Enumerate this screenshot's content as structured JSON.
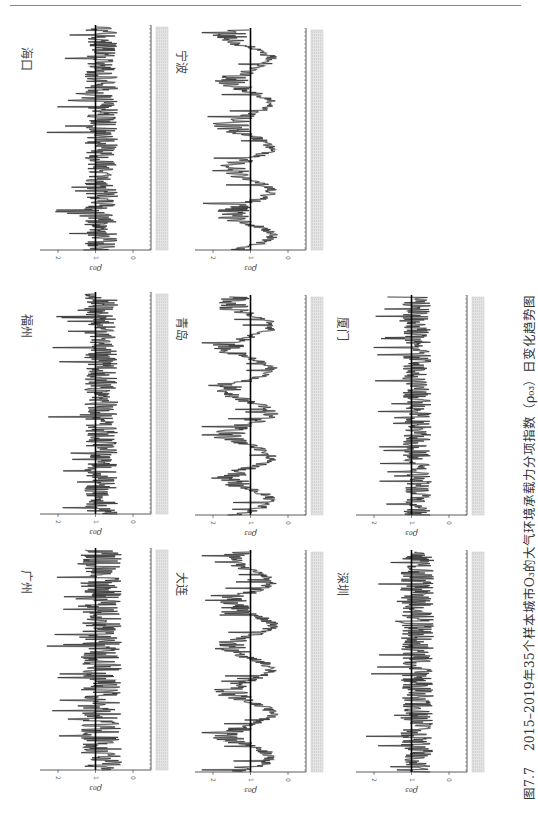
{
  "header": {
    "text": ""
  },
  "caption": {
    "figure_no": "图7.7",
    "text": "2015–2019年35个样本城市O₃的大气环境承载力分项指数（ρ₀₃）日变化趋势图"
  },
  "chart_data": [
    {
      "type": "line",
      "title": "海口",
      "xlabel": "日期 (2015–2019)",
      "ylabel": "ρ_O3",
      "ylim": [
        0,
        2.5
      ],
      "yticks": [
        0,
        1,
        2
      ],
      "reference_line": 1,
      "orientation": "rotated-90",
      "mean_level": 0.8,
      "spikes_to": 2.0
    },
    {
      "type": "line",
      "title": "宁波",
      "xlabel": "日期 (2015–2019)",
      "ylabel": "ρ_O3",
      "ylim": [
        0,
        2.5
      ],
      "yticks": [
        0,
        1,
        2
      ],
      "reference_line": 1,
      "orientation": "rotated-90",
      "mean_level": 1.1,
      "seasonal": true
    },
    {
      "type": "line",
      "title": "福州",
      "xlabel": "日期 (2015–2019)",
      "ylabel": "ρ_O3",
      "ylim": [
        0,
        2.5
      ],
      "yticks": [
        0,
        1,
        2
      ],
      "reference_line": 1,
      "orientation": "rotated-90",
      "mean_level": 1.0
    },
    {
      "type": "line",
      "title": "青岛",
      "xlabel": "日期 (2015–2019)",
      "ylabel": "ρ_O3",
      "ylim": [
        0,
        2.5
      ],
      "yticks": [
        0,
        1,
        2
      ],
      "reference_line": 1,
      "orientation": "rotated-90",
      "mean_level": 1.0,
      "seasonal": true
    },
    {
      "type": "line",
      "title": "厦门",
      "xlabel": "日期 (2015–2019)",
      "ylabel": "ρ_O3",
      "ylim": [
        0,
        2.5
      ],
      "yticks": [
        0,
        1,
        2
      ],
      "reference_line": 1,
      "orientation": "rotated-90",
      "mean_level": 0.9
    },
    {
      "type": "line",
      "title": "广州",
      "xlabel": "日期 (2015–2019)",
      "ylabel": "ρ_O3",
      "ylim": [
        0,
        2.5
      ],
      "yticks": [
        0,
        1,
        2
      ],
      "reference_line": 1,
      "orientation": "rotated-90",
      "mean_level": 1.0,
      "spikes_to": 2.2
    },
    {
      "type": "line",
      "title": "大连",
      "xlabel": "日期 (2015–2019)",
      "ylabel": "ρ_O3",
      "ylim": [
        0,
        2.5
      ],
      "yticks": [
        0,
        1,
        2
      ],
      "reference_line": 1,
      "orientation": "rotated-90",
      "mean_level": 1.0,
      "seasonal": true
    },
    {
      "type": "line",
      "title": "深圳",
      "xlabel": "日期 (2015–2019)",
      "ylabel": "ρ_O3",
      "ylim": [
        0,
        2.5
      ],
      "yticks": [
        0,
        1,
        2
      ],
      "reference_line": 1,
      "orientation": "rotated-90",
      "mean_level": 0.9
    }
  ],
  "panels": [
    {
      "city": "海口",
      "x": 38,
      "y": 25,
      "h": 225,
      "seasonal": false,
      "seed": 11,
      "spread": 0.45
    },
    {
      "city": "宁波",
      "x": 193,
      "y": 28,
      "h": 222,
      "seasonal": true,
      "seed": 23,
      "spread": 0.5
    },
    {
      "city": "福州",
      "x": 38,
      "y": 292,
      "h": 222,
      "seasonal": false,
      "seed": 37,
      "spread": 0.45
    },
    {
      "city": "青岛",
      "x": 193,
      "y": 295,
      "h": 220,
      "seasonal": true,
      "seed": 41,
      "spread": 0.5
    },
    {
      "city": "厦门",
      "x": 354,
      "y": 295,
      "h": 220,
      "seasonal": false,
      "seed": 53,
      "spread": 0.38
    },
    {
      "city": "广州",
      "x": 38,
      "y": 548,
      "h": 222,
      "seasonal": false,
      "seed": 67,
      "spread": 0.55
    },
    {
      "city": "大连",
      "x": 193,
      "y": 550,
      "h": 222,
      "seasonal": true,
      "seed": 71,
      "spread": 0.5
    },
    {
      "city": "深圳",
      "x": 354,
      "y": 550,
      "h": 222,
      "seasonal": false,
      "seed": 83,
      "spread": 0.45
    }
  ],
  "axis": {
    "tick_labels": [
      "2",
      "1",
      "0"
    ],
    "ylabel": "ρ₀₃"
  }
}
